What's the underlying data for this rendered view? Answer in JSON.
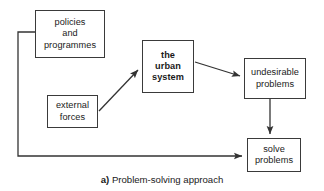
{
  "figure": {
    "caption_label": "a)",
    "caption_text": "Problem-solving approach"
  },
  "colors": {
    "background": "#ffffff",
    "box_border": "#3a3a3a",
    "text": "#1a1a1a",
    "connector": "#333333"
  },
  "nodes": {
    "policies": {
      "label": "policies\nand\nprogrammes"
    },
    "external": {
      "label": "external\nforces"
    },
    "urban": {
      "label": "the\nurban\nsystem"
    },
    "undesirable": {
      "label": "undesirable\nproblems"
    },
    "solve": {
      "label": "solve\nproblems"
    }
  },
  "connectors": [
    {
      "name": "policies-to-solve",
      "from": "policies",
      "to": "solve",
      "style": "elbow",
      "arrowhead": "end"
    },
    {
      "name": "external-to-urban",
      "from": "external",
      "to": "urban",
      "style": "diagonal",
      "arrowhead": "end"
    },
    {
      "name": "urban-to-undesirable",
      "from": "urban",
      "to": "undesirable",
      "style": "diagonal",
      "arrowhead": "end"
    },
    {
      "name": "undesirable-to-solve",
      "from": "undesirable",
      "to": "solve",
      "style": "vertical",
      "arrowhead": "end"
    }
  ]
}
